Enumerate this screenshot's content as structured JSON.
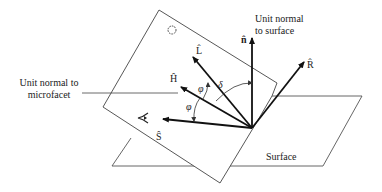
{
  "diagram": {
    "labels": {
      "unit_normal_surface_line1": "Unit normal",
      "unit_normal_surface_line2": "to surface",
      "unit_normal_microfacet_line1": "Unit normal to",
      "unit_normal_microfacet_line2": "microfacet",
      "surface": "Surface"
    },
    "vectors": {
      "n": "n̂",
      "L": "L̂",
      "H": "Ĥ",
      "R": "R̂",
      "S": "Ŝ"
    },
    "angles": {
      "phi_upper": "φ",
      "phi_lower": "φ",
      "delta": "δ"
    },
    "icons": [
      "light-source-icon",
      "viewer-eye-icon"
    ],
    "colors": {
      "line": "#333333",
      "arrow": "#111111",
      "background": "#ffffff"
    }
  }
}
